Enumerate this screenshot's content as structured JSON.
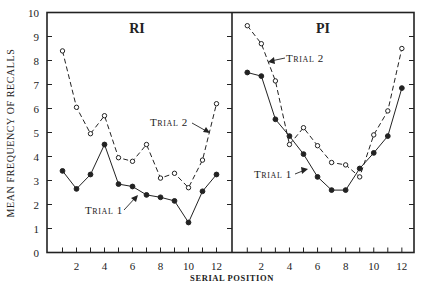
{
  "chart_data": [
    {
      "type": "line",
      "panel": "RI",
      "title": "RI",
      "xlabel": "SERIAL POSITION",
      "ylabel": "MEAN FREQUENCY OF RECALLS",
      "x": [
        1,
        2,
        3,
        4,
        5,
        6,
        7,
        8,
        9,
        10,
        11,
        12
      ],
      "xticks": [
        2,
        4,
        6,
        8,
        10,
        12
      ],
      "ylim": [
        0,
        10
      ],
      "yticks": [
        0,
        1,
        2,
        3,
        4,
        5,
        6,
        7,
        8,
        9,
        10
      ],
      "series": [
        {
          "name": "Trial 1",
          "style": "solid",
          "marker": "filled-circle",
          "values": [
            3.4,
            2.65,
            3.25,
            4.5,
            2.85,
            2.75,
            2.4,
            2.3,
            2.15,
            1.25,
            2.55,
            3.25
          ]
        },
        {
          "name": "Trial 2",
          "style": "dashed",
          "marker": "open-circle",
          "values": [
            8.4,
            6.05,
            4.95,
            5.7,
            3.95,
            3.8,
            4.5,
            3.1,
            3.3,
            2.7,
            3.85,
            6.2
          ]
        }
      ],
      "annotations": [
        {
          "text": "Trial 1",
          "points_to_series": "Trial 1"
        },
        {
          "text": "Trial 2",
          "points_to_series": "Trial 2"
        }
      ]
    },
    {
      "type": "line",
      "panel": "PI",
      "title": "PI",
      "xlabel": "SERIAL POSITION",
      "x": [
        1,
        2,
        3,
        4,
        5,
        6,
        7,
        8,
        9,
        10,
        11,
        12
      ],
      "xticks": [
        2,
        4,
        6,
        8,
        10,
        12
      ],
      "ylim": [
        0,
        10
      ],
      "series": [
        {
          "name": "Trial 1",
          "style": "solid",
          "marker": "filled-circle",
          "values": [
            7.5,
            7.35,
            5.55,
            4.85,
            4.1,
            3.15,
            2.6,
            2.6,
            3.5,
            4.15,
            4.85,
            6.85
          ]
        },
        {
          "name": "Trial 2",
          "style": "dashed",
          "marker": "open-circle",
          "values": [
            9.45,
            8.7,
            7.15,
            4.5,
            5.2,
            4.45,
            3.75,
            3.65,
            3.15,
            4.9,
            5.9,
            8.5
          ]
        }
      ],
      "annotations": [
        {
          "text": "Trial 1",
          "points_to_series": "Trial 1"
        },
        {
          "text": "Trial 2",
          "points_to_series": "Trial 2"
        }
      ]
    }
  ],
  "labels": {
    "ylabel": "MEAN FREQUENCY OF RECALLS",
    "xlabel": "SERIAL POSITION",
    "panel_left_title": "RI",
    "panel_right_title": "PI",
    "trial1": "Trial 1",
    "trial2": "Trial 2"
  }
}
